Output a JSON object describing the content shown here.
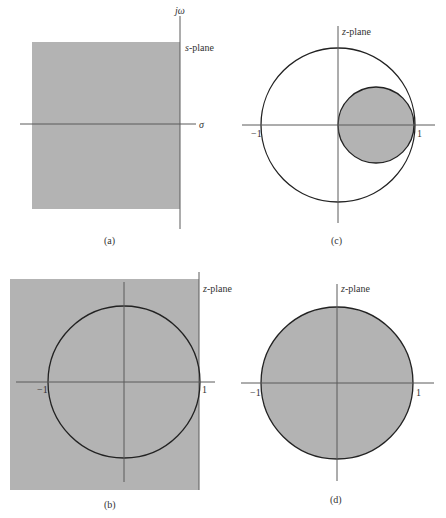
{
  "colors": {
    "shade": "#b3b3b3",
    "axis": "#5a5a5a",
    "circle": "#222222",
    "text": "#333333",
    "background": "#ffffff"
  },
  "panels": {
    "a": {
      "caption": "(a)",
      "plane_label": "s-plane",
      "plane_label_var": "s",
      "plane_label_rest": "-plane",
      "vertical_axis_label": "jω",
      "horizontal_axis_label": "σ",
      "description": "Left half of s-plane shaded"
    },
    "b": {
      "caption": "(b)",
      "plane_label": "z-plane",
      "plane_label_var": "z",
      "plane_label_rest": "-plane",
      "tick_neg": "−1",
      "tick_pos": "1",
      "description": "Entire z-plane region shaded with unit circle drawn"
    },
    "c": {
      "caption": "(c)",
      "plane_label": "z-plane",
      "plane_label_var": "z",
      "plane_label_rest": "-plane",
      "tick_neg": "−1",
      "tick_pos": "1",
      "description": "Unit circle with shaded circle of radius 1/2 centered at 1/2"
    },
    "d": {
      "caption": "(d)",
      "plane_label": "z-plane",
      "plane_label_var": "z",
      "plane_label_rest": "-plane",
      "tick_neg": "−1",
      "tick_pos": "1",
      "description": "Interior of unit circle shaded"
    }
  }
}
